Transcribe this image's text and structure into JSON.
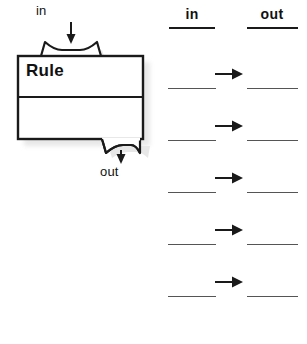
{
  "diagram": {
    "machine": {
      "box_label": "Rule",
      "input_label": "in",
      "output_label": "out",
      "input_arrow_icon": "arrow-down-icon",
      "output_arrow_icon": "arrow-down-icon",
      "box_color": "#1a1a1a",
      "shadow_color": "#c9c9c9"
    },
    "table": {
      "columns": [
        {
          "key": "in",
          "label": "in"
        },
        {
          "key": "out",
          "label": "out"
        }
      ],
      "arrow_icon": "arrow-right-icon",
      "row_count": 5,
      "rows": [
        {
          "in": "",
          "out": "",
          "arrow": "→"
        },
        {
          "in": "",
          "out": "",
          "arrow": "→"
        },
        {
          "in": "",
          "out": "",
          "arrow": "→"
        },
        {
          "in": "",
          "out": "",
          "arrow": "→"
        },
        {
          "in": "",
          "out": "",
          "arrow": "→"
        }
      ],
      "row_line_y": [
        88,
        140,
        192,
        244,
        296
      ],
      "arrow_y": [
        66,
        118,
        170,
        222,
        274
      ],
      "line_color": "#555555",
      "header_rule_color": "#1a1a1a"
    }
  }
}
